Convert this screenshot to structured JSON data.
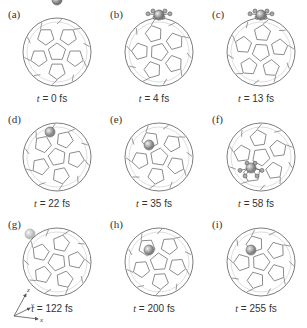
{
  "figure": {
    "panels": [
      {
        "id": "a",
        "label": "(a)",
        "t_var": "t",
        "time": "= 0 fs",
        "atom": "outside-top",
        "bonds": false,
        "col": 0,
        "row": 0
      },
      {
        "id": "b",
        "label": "(b)",
        "t_var": "t",
        "time": "= 4 fs",
        "atom": "surface-top",
        "bonds": true,
        "col": 1,
        "row": 0
      },
      {
        "id": "c",
        "label": "(c)",
        "t_var": "t",
        "time": "= 13 fs",
        "atom": "surface-top",
        "bonds": true,
        "col": 2,
        "row": 0
      },
      {
        "id": "d",
        "label": "(d)",
        "t_var": "t",
        "time": "= 22 fs",
        "atom": "inside-upper-right",
        "bonds": false,
        "col": 0,
        "row": 1
      },
      {
        "id": "e",
        "label": "(e)",
        "t_var": "t",
        "time": "= 35 fs",
        "atom": "inside-center",
        "bonds": false,
        "col": 1,
        "row": 1
      },
      {
        "id": "f",
        "label": "(f)",
        "t_var": "t",
        "time": "= 58 fs",
        "atom": "surface-bottom",
        "bonds": true,
        "col": 2,
        "row": 1
      },
      {
        "id": "g",
        "label": "(g)",
        "t_var": "t",
        "time": "= 122 fs",
        "atom": "faint-upper-left",
        "bonds": false,
        "col": 0,
        "row": 2
      },
      {
        "id": "h",
        "label": "(h)",
        "t_var": "t",
        "time": "= 200 fs",
        "atom": "inside-center",
        "bonds": false,
        "col": 1,
        "row": 2
      },
      {
        "id": "i",
        "label": "(i)",
        "t_var": "t",
        "time": "= 255 fs",
        "atom": "inside-center",
        "bonds": false,
        "col": 2,
        "row": 2
      }
    ],
    "axes": {
      "x": "x",
      "y": "y",
      "z": "z"
    },
    "colors": {
      "cage": "#6e6e6e",
      "cage_back": "#c8c8c8",
      "atom": "#7a7a7a",
      "text": "#333333"
    }
  }
}
